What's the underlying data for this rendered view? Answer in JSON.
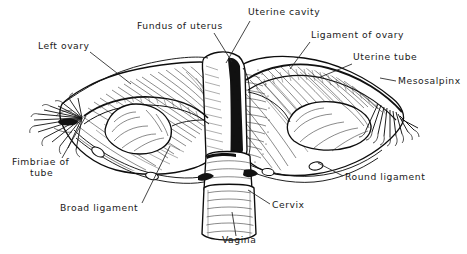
{
  "figure": {
    "kind": "anatomical-line-drawing",
    "background_color": "#ffffff",
    "ink_color": "#111111",
    "label_color": "#1a1a1a"
  },
  "labels": [
    {
      "id": "fundus-of-uterus",
      "text": "Fundus of uterus",
      "x": 137,
      "y": 29,
      "anchor": "start",
      "leader": "M214,33 L232,62"
    },
    {
      "id": "uterine-cavity",
      "text": "Uterine cavity",
      "x": 248,
      "y": 15,
      "anchor": "start",
      "leader": "M250,21 L226,63"
    },
    {
      "id": "ligament-of-ovary",
      "text": "Ligament of ovary",
      "x": 311,
      "y": 38,
      "anchor": "start",
      "leader": "M310,42 L290,69"
    },
    {
      "id": "left-ovary",
      "text": "Left ovary",
      "x": 38,
      "y": 49,
      "anchor": "start",
      "leader": "M90,52 L131,84"
    },
    {
      "id": "uterine-tube",
      "text": "Uterine tube",
      "x": 353,
      "y": 60,
      "anchor": "start",
      "leader": "M352,64 L318,78"
    },
    {
      "id": "mesosalpinx",
      "text": "Mesosalpinx",
      "x": 398,
      "y": 84,
      "anchor": "start",
      "leader": "M396,81 L380,78"
    },
    {
      "id": "fimbriae-of-tube",
      "text": "Fimbriae of",
      "x": 12,
      "y": 165,
      "anchor": "start",
      "leader": "M62,158 L86,116"
    },
    {
      "id": "fimbriae-of-tube-line2",
      "text": "tube",
      "x": 30,
      "y": 176,
      "anchor": "start",
      "leader": ""
    },
    {
      "id": "broad-ligament",
      "text": "Broad ligament",
      "x": 60,
      "y": 211,
      "anchor": "start",
      "leader": "M142,203 L170,146"
    },
    {
      "id": "round-ligament",
      "text": "Round ligament",
      "x": 345,
      "y": 180,
      "anchor": "start",
      "leader": "M343,176 L318,163"
    },
    {
      "id": "cervix",
      "text": "Cervix",
      "x": 272,
      "y": 208,
      "anchor": "start",
      "leader": "M270,204 L248,190"
    },
    {
      "id": "vagina",
      "text": "Vagina",
      "x": 222,
      "y": 243,
      "anchor": "start",
      "leader": "M236,236 L232,212"
    }
  ],
  "structures": [
    {
      "id": "left-ovary-body",
      "name": "Left ovary"
    },
    {
      "id": "right-ovary-body",
      "name": "Right ovary"
    },
    {
      "id": "left-uterine-tube",
      "name": "Left uterine tube"
    },
    {
      "id": "right-uterine-tube",
      "name": "Right uterine tube"
    },
    {
      "id": "left-fimbriae",
      "name": "Left fimbriae"
    },
    {
      "id": "right-fimbriae",
      "name": "Right fimbriae"
    },
    {
      "id": "left-broad-ligament",
      "name": "Left broad ligament"
    },
    {
      "id": "right-broad-ligament",
      "name": "Right broad ligament"
    },
    {
      "id": "uterus-body",
      "name": "Body of uterus"
    },
    {
      "id": "uterine-cavity-cutaway",
      "name": "Uterine cavity cut-away"
    },
    {
      "id": "cervix-body",
      "name": "Cervix"
    },
    {
      "id": "vagina-body",
      "name": "Vagina"
    },
    {
      "id": "left-round-ligament",
      "name": "Left round ligament"
    },
    {
      "id": "right-round-ligament",
      "name": "Right round ligament"
    }
  ]
}
